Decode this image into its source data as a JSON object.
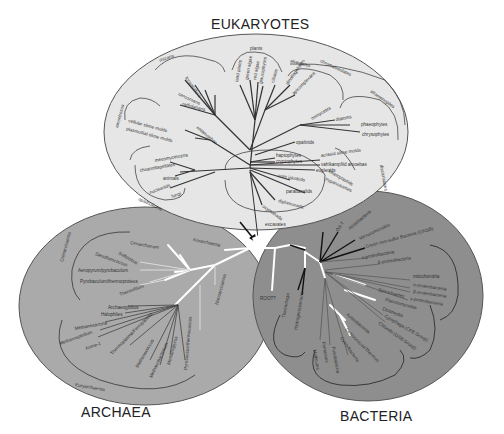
{
  "titles": {
    "eukaryotes": "EUKARYOTES",
    "archaea": "ARCHAEA",
    "bacteria": "BACTERIA"
  },
  "colors": {
    "eukaryotes_fill": "#e6e6e6",
    "archaea_fill": "#aaaaaa",
    "bacteria_fill": "#8e8e8e",
    "outline": "#555555",
    "branch_dark": "#333333",
    "branch_white": "#ffffff",
    "branch_black": "#111111"
  },
  "eukaryotes": {
    "groups": [
      "plants",
      "rhizaria",
      "alveolates",
      "chromalveolates",
      "stramenopiles",
      "amoebozoa",
      "opisthokonts",
      "excavates",
      "discicristates"
    ],
    "taxa": [
      "land plants",
      "green algae",
      "red algae",
      "glaucophytes",
      "foraminifera",
      "radiolarians",
      "cercozoans",
      "ciliates",
      "dinoflagellates",
      "apicomplexans",
      "haptophytes",
      "cryptophytes",
      "diatoms",
      "phaeophytes",
      "chrysophytes",
      "oomycetes",
      "opalinids",
      "cellular slime molds",
      "plasmodial slime molds",
      "entamoebae",
      "mesomycetozoa",
      "choanoflagellates",
      "animals",
      "nucleariids",
      "fungi",
      "acrasid slime molds",
      "vahlkampfiid amoebas",
      "euglenids",
      "kinetoplastids",
      "trypanosomes",
      "core jakobids",
      "parabasalids",
      "diplomonads",
      "oxymonads"
    ]
  },
  "archaea": {
    "groups": [
      "Crenarchaeota",
      "Euryarchaeota"
    ],
    "taxa": [
      "Cenarchaeum",
      "Korarchaeota",
      "Sulfolobus",
      "Desulfurococcus",
      "Aeropyrum/pyrobaculum",
      "Pyrobaculum/thermoproteus",
      "Thermofilum",
      "Nanoarchaeota",
      "Archaeoglobus",
      "Halophiles",
      "Methanosarcina",
      "Methanospirillum",
      "Anme-1",
      "Thermoplasma/Ferroplasma",
      "Methanococcus",
      "Methanobacterium",
      "Methanopyrus",
      "Pyrococcus/thermococcus"
    ]
  },
  "bacteria": {
    "root_label": "ROOT?",
    "taxa": [
      "OS-T",
      "Acidobacteria",
      "Verrucomicrobia",
      "Green non-sulfur Bacteria (GNSB)",
      "ε-proteobacteria",
      "δ-proteobacteria",
      "mitochondria",
      "α-proteobacteria",
      "β-proteobacteria",
      "γ-proteobacteria",
      "Spirochaetes",
      "Planctomycetes",
      "Chlamydia",
      "Cytophaga (CFB Group)",
      "Chlorobi (GSB Group)",
      "Actinobacteria",
      "Deinococcus/Thermus",
      "Cyanobacteria",
      "Firmicutes",
      "Fusobacteria",
      "Mollicutes",
      "Thermotoga",
      "Hydrogenobacteria"
    ]
  }
}
